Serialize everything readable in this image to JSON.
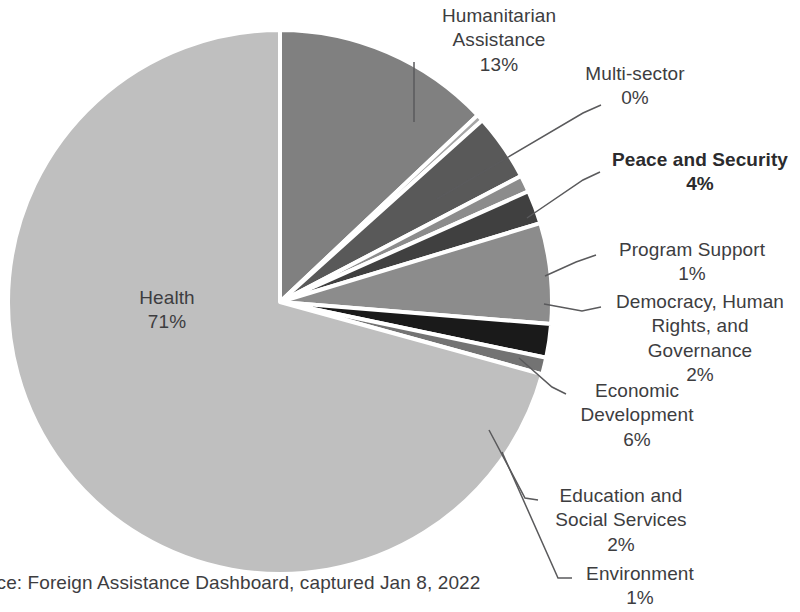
{
  "chart_data": {
    "type": "pie",
    "title": "",
    "legend_position": "none",
    "start_angle_deg": 0,
    "direction": "clockwise",
    "categories": [
      "Humanitarian Assistance",
      "Multi-sector",
      "Peace and Security",
      "Program Support",
      "Democracy, Human Rights, and Governance",
      "Economic Development",
      "Education and Social Services",
      "Environment",
      "Health"
    ],
    "values": [
      13,
      0,
      4,
      1,
      2,
      6,
      2,
      1,
      71
    ],
    "value_labels": [
      "13%",
      "0%",
      "4%",
      "1%",
      "2%",
      "6%",
      "2%",
      "1%",
      "71%"
    ],
    "colors": [
      "#808080",
      "#a6a6a6",
      "#595959",
      "#8c8c8c",
      "#404040",
      "#8c8c8c",
      "#1a1a1a",
      "#737373",
      "#bfbfbf"
    ],
    "slices": [
      {
        "name": "Humanitarian Assistance",
        "label_lines": [
          "Humanitarian",
          "Assistance"
        ],
        "pct": "13%",
        "value": 13,
        "color": "#808080",
        "bold": false
      },
      {
        "name": "Multi-sector",
        "label_lines": [
          "Multi-sector"
        ],
        "pct": "0%",
        "value": 0.4,
        "color": "#a6a6a6",
        "bold": false
      },
      {
        "name": "Peace and Security",
        "label_lines": [
          "Peace and Security"
        ],
        "pct": "4%",
        "value": 4,
        "color": "#595959",
        "bold": true
      },
      {
        "name": "Program Support",
        "label_lines": [
          "Program Support"
        ],
        "pct": "1%",
        "value": 1,
        "color": "#8c8c8c",
        "bold": false
      },
      {
        "name": "Democracy, Human Rights, and Governance",
        "label_lines": [
          "Democracy, Human",
          "Rights, and",
          "Governance"
        ],
        "pct": "2%",
        "value": 2,
        "color": "#404040",
        "bold": false
      },
      {
        "name": "Economic Development",
        "label_lines": [
          "Economic",
          "Development"
        ],
        "pct": "6%",
        "value": 6,
        "color": "#8c8c8c",
        "bold": false
      },
      {
        "name": "Education and Social Services",
        "label_lines": [
          "Education and",
          "Social Services"
        ],
        "pct": "2%",
        "value": 2,
        "color": "#1a1a1a",
        "bold": false
      },
      {
        "name": "Environment",
        "label_lines": [
          "Environment"
        ],
        "pct": "1%",
        "value": 1,
        "color": "#737373",
        "bold": false
      },
      {
        "name": "Health",
        "label_lines": [
          "Health"
        ],
        "pct": "71%",
        "value": 71,
        "color": "#bfbfbf",
        "bold": false
      }
    ]
  },
  "labels": {
    "humanitarian": {
      "line1": "Humanitarian",
      "line2": "Assistance",
      "pct": "13%"
    },
    "multisector": {
      "line1": "Multi-sector",
      "pct": "0%"
    },
    "peace": {
      "line1": "Peace and Security",
      "pct": "4%"
    },
    "program": {
      "line1": "Program Support",
      "pct": "1%"
    },
    "democracy": {
      "line1": "Democracy, Human",
      "line2": "Rights, and",
      "line3": "Governance",
      "pct": "2%"
    },
    "economic": {
      "line1": "Economic",
      "line2": "Development",
      "pct": "6%"
    },
    "education": {
      "line1": "Education and",
      "line2": "Social Services",
      "pct": "2%"
    },
    "environment": {
      "line1": "Environment",
      "pct": "1%"
    },
    "health": {
      "line1": "Health",
      "pct": "71%"
    }
  },
  "caption": {
    "text": "Source: Foreign Assistance Dashboard, captured Jan 8, 2022"
  }
}
